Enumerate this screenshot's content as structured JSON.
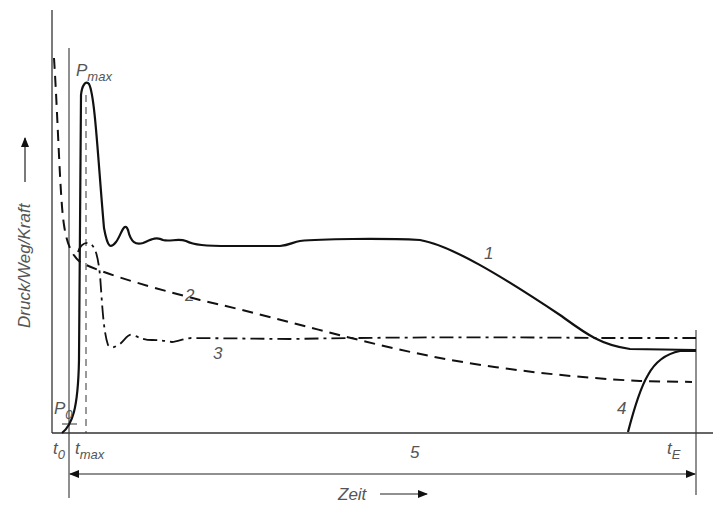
{
  "diagram": {
    "ylabel": "Druck/Weg/Kraft",
    "xlabel": "Zeit",
    "labels": {
      "p_max_main": "P",
      "p_max_sub": "max",
      "p0_main": "P",
      "p0_sub": "0",
      "t0_main": "t",
      "t0_sub": "0",
      "tmax_main": "t",
      "tmax_sub": "max",
      "tE_main": "t",
      "tE_sub": "E",
      "curve1": "1",
      "curve2": "2",
      "curve3": "3",
      "curve4": "4",
      "interval5": "5"
    },
    "colors": {
      "line": "#111111",
      "text": "#555555",
      "background": "#ffffff"
    }
  }
}
